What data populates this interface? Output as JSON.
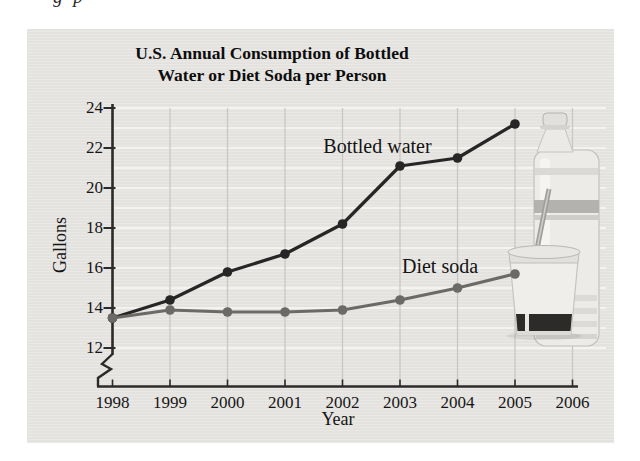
{
  "page": {
    "fragment_text": "g p"
  },
  "colors": {
    "panel_bg": "#e8e6e3",
    "grid_horizontal": "#f4f3f0",
    "grid_vertical": "#c9c7c3",
    "axis": "#2b2b2b",
    "text": "#151515",
    "bottled_water_line": "#262626",
    "diet_soda_line": "#6b6a67"
  },
  "chart_data": {
    "type": "line",
    "title": "U.S. Annual Consumption of Bottled Water or Diet Soda per Person",
    "title_lines": [
      "U.S. Annual Consumption of Bottled",
      "Water or Diet Soda per Person"
    ],
    "xlabel": "Year",
    "ylabel": "Gallons",
    "x": [
      1998,
      1999,
      2000,
      2001,
      2002,
      2003,
      2004,
      2005
    ],
    "x_ticks": [
      "1998",
      "1999",
      "2000",
      "2001",
      "2002",
      "2003",
      "2004",
      "2005",
      "2006"
    ],
    "y_ticks": [
      12,
      14,
      16,
      18,
      20,
      22,
      24
    ],
    "ylim": [
      12,
      24
    ],
    "xlim": [
      1998,
      2006
    ],
    "grid": true,
    "axis_break_bottom": true,
    "legend_position": "inline-annotations",
    "series": [
      {
        "name": "Bottled water",
        "color": "#262626",
        "values": [
          13.5,
          14.4,
          15.8,
          16.7,
          18.2,
          21.1,
          21.5,
          23.2
        ]
      },
      {
        "name": "Diet soda",
        "color": "#6b6a67",
        "values": [
          13.5,
          13.9,
          13.8,
          13.8,
          13.9,
          14.4,
          15.0,
          15.7
        ]
      }
    ],
    "annotations": [
      {
        "text": "Bottled water",
        "series": "Bottled water"
      },
      {
        "text": "Diet soda",
        "series": "Diet soda"
      }
    ],
    "decorations": [
      "water-bottle-photo",
      "diet-soda-cup-photo"
    ]
  }
}
